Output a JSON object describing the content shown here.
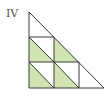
{
  "figure": {
    "label": "IV",
    "colors": {
      "fill": "#d3e4b3",
      "stroke": "#3a3a3a",
      "label": "#555555"
    },
    "grid": {
      "rows": 3,
      "cols": 3,
      "shaded_cells": [
        {
          "row": 2,
          "col": 1,
          "half": "lower-left"
        },
        {
          "row": 2,
          "col": 2,
          "half": "lower-left"
        },
        {
          "row": 3,
          "col": 1,
          "half": "lower-left"
        },
        {
          "row": 3,
          "col": 2,
          "half": "lower-left"
        }
      ]
    }
  }
}
